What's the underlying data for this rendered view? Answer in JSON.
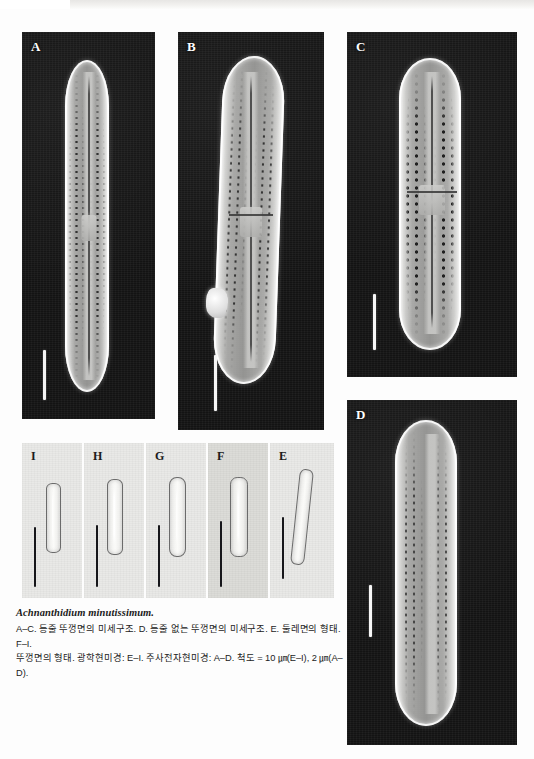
{
  "figure": {
    "species_name": "Achnanthidium minutissimum.",
    "caption_lines": [
      "A–C. 등줄 뚜껑면의 미세구조. D. 등줄 없는 뚜껑면의 미세구조. E. 둘레면의 형태. F–I.",
      "뚜껑면의 형태. 광학현미경: E–I. 주사전자현미경: A–D. 척도 = 10 ㎛(E–I), 2 ㎛(A–D)."
    ],
    "scale_note": {
      "lm_scale": "10 ㎛(E–I)",
      "sem_scale": "2 ㎛(A–D)"
    },
    "background_color": "#ffffff",
    "sem_background_color": "#131313",
    "lm_background_color": "#e9e9e7",
    "scalebar_color_sem": "#f6f6f6",
    "scalebar_color_lm": "#16161a"
  },
  "panels": {
    "sem": [
      {
        "label": "A",
        "modality": "SEM",
        "description": "등줄 뚜껑면의 미세구조",
        "valve_type": "raphe-valve",
        "has_raphe": true,
        "has_debris": false
      },
      {
        "label": "B",
        "modality": "SEM",
        "description": "등줄 뚜껑면의 미세구조",
        "valve_type": "raphe-valve",
        "has_raphe": true,
        "has_debris": true
      },
      {
        "label": "C",
        "modality": "SEM",
        "description": "등줄 뚜껑면의 미세구조",
        "valve_type": "raphe-valve",
        "has_raphe": true,
        "has_debris": false
      },
      {
        "label": "D",
        "modality": "SEM",
        "description": "등줄 없는 뚜껑면의 미세구조",
        "valve_type": "rapheless-valve",
        "has_raphe": false,
        "has_debris": false
      }
    ],
    "lm": [
      {
        "label": "I",
        "modality": "LM",
        "description": "뚜껑면의 형태",
        "view": "valve"
      },
      {
        "label": "H",
        "modality": "LM",
        "description": "뚜껑면의 형태",
        "view": "valve"
      },
      {
        "label": "G",
        "modality": "LM",
        "description": "뚜껑면의 형태",
        "view": "valve"
      },
      {
        "label": "F",
        "modality": "LM",
        "description": "뚜껑면의 형태",
        "view": "valve"
      },
      {
        "label": "E",
        "modality": "LM",
        "description": "둘레면의 형태",
        "view": "girdle"
      }
    ]
  }
}
